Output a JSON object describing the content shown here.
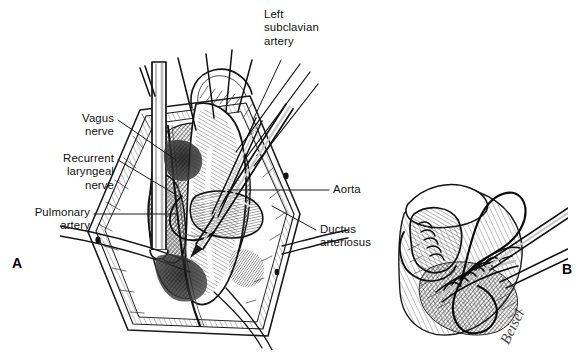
{
  "figure": {
    "kind": "surgical-illustration",
    "background_color": "#ffffff",
    "ink_color": "#1a1a1a",
    "label_color": "#111111"
  },
  "panels": [
    {
      "letter": "A",
      "x": 12,
      "y": 255
    },
    {
      "letter": "B",
      "x": 562,
      "y": 261
    }
  ],
  "labels": [
    {
      "name": "left-subclavian-artery",
      "text": "Left\nsubclavian\nartery",
      "align": "left",
      "x": 264,
      "y": 8,
      "leader": {
        "x1": 281,
        "y1": 60,
        "x2": 253,
        "y2": 120
      }
    },
    {
      "name": "vagus-nerve",
      "text": "Vagus\nnerve",
      "align": "right",
      "x": 18,
      "y": 112,
      "w": 96,
      "leader": {
        "x1": 118,
        "y1": 120,
        "x2": 176,
        "y2": 160
      }
    },
    {
      "name": "recurrent-laryngeal-nerve",
      "text": "Recurrent\nlaryngeal\nnerve",
      "align": "right",
      "x": 6,
      "y": 152,
      "w": 108,
      "leader": {
        "x1": 118,
        "y1": 160,
        "x2": 178,
        "y2": 196
      }
    },
    {
      "name": "pulmonary-artery",
      "text": "Pulmonary\nartery",
      "align": "right",
      "x": 8,
      "y": 206,
      "w": 82,
      "leader": {
        "x1": 94,
        "y1": 214,
        "x2": 178,
        "y2": 214
      }
    },
    {
      "name": "aorta",
      "text": "Aorta",
      "align": "left",
      "x": 333,
      "y": 183,
      "leader": {
        "x1": 329,
        "y1": 190,
        "x2": 228,
        "y2": 190
      }
    },
    {
      "name": "ductus-arteriosus",
      "text": "Ductus\narteriosus",
      "align": "left",
      "x": 320,
      "y": 223,
      "leader": {
        "x1": 316,
        "y1": 230,
        "x2": 272,
        "y2": 206
      }
    }
  ],
  "signature": {
    "text": "Beisel",
    "x": 512,
    "y": 330
  }
}
